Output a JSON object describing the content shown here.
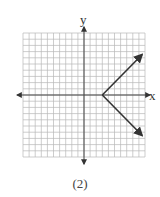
{
  "chart_data": {
    "type": "line",
    "title": "",
    "caption": "(2)",
    "xlabel": "x",
    "ylabel": "y",
    "grid": true,
    "xlim": [
      -10,
      10
    ],
    "ylim": [
      -10,
      10
    ],
    "grid_step": 1,
    "relation": "x = |y| + 3",
    "series": [
      {
        "name": "upper-ray",
        "points": [
          [
            3,
            0
          ],
          [
            9.5,
            6.5
          ]
        ],
        "arrow_end": true
      },
      {
        "name": "lower-ray",
        "points": [
          [
            3,
            0
          ],
          [
            9.5,
            -6.5
          ]
        ],
        "arrow_end": true
      }
    ],
    "vertex": [
      3,
      0
    ],
    "colors": {
      "grid": "#b8b8b8",
      "axes": "#444444",
      "line": "#333333"
    }
  },
  "labels": {
    "x_axis": "x",
    "y_axis": "y",
    "caption": "(2)"
  }
}
